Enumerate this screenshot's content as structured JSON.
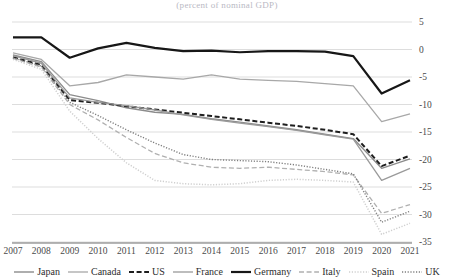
{
  "chart_data": {
    "type": "line",
    "title": "(percent of nominal GDP)",
    "xlabel": "",
    "ylabel": "",
    "x": [
      2007,
      2008,
      2009,
      2010,
      2011,
      2012,
      2013,
      2014,
      2015,
      2016,
      2017,
      2018,
      2019,
      2020,
      2021
    ],
    "xtick_labels": [
      "2007",
      "2008",
      "2009",
      "2010",
      "2011",
      "2012",
      "2013",
      "2014",
      "2015",
      "2016",
      "2017",
      "2018",
      "2019",
      "2020",
      "2021"
    ],
    "ytick_labels": [
      "5",
      "0",
      "-5",
      "-10",
      "-15",
      "-20",
      "-25",
      "-30",
      "-35"
    ],
    "ytick_values": [
      5,
      0,
      -5,
      -10,
      -15,
      -20,
      -25,
      -30,
      -35
    ],
    "ylim": [
      -35,
      5
    ],
    "grid": true,
    "legend_position": "bottom",
    "series": [
      {
        "name": "Japan",
        "color": "#8c8c8c",
        "style": "solid",
        "width": 1.4,
        "values": [
          -1.0,
          -2.2,
          -8.2,
          -9.3,
          -10.6,
          -11.4,
          -11.8,
          -12.6,
          -13.2,
          -13.9,
          -14.6,
          -15.4,
          -16.2,
          -21.6,
          -19.9
        ]
      },
      {
        "name": "Canada",
        "color": "#a8a8a8",
        "style": "solid",
        "width": 1.3,
        "values": [
          -0.6,
          -1.8,
          -6.6,
          -6.0,
          -4.6,
          -5.0,
          -5.4,
          -4.6,
          -5.4,
          -5.6,
          -5.8,
          -6.2,
          -6.6,
          -13.1,
          -11.7
        ]
      },
      {
        "name": "US",
        "color": "#1e1e1e",
        "style": "dashed",
        "width": 2.0,
        "values": [
          -1.4,
          -2.8,
          -9.2,
          -9.7,
          -10.3,
          -10.9,
          -11.5,
          -12.1,
          -12.7,
          -13.3,
          -13.9,
          -14.6,
          -15.4,
          -21.2,
          -19.3
        ]
      },
      {
        "name": "France",
        "color": "#9a9a9a",
        "style": "solid",
        "width": 1.3,
        "values": [
          -1.1,
          -2.5,
          -8.8,
          -9.6,
          -10.2,
          -11.0,
          -11.9,
          -12.7,
          -13.4,
          -14.0,
          -14.7,
          -15.5,
          -16.3,
          -23.8,
          -21.6
        ]
      },
      {
        "name": "Germany",
        "color": "#171717",
        "style": "solid",
        "width": 2.2,
        "values": [
          2.2,
          2.2,
          -1.5,
          0.2,
          1.2,
          0.3,
          -0.3,
          -0.2,
          -0.5,
          -0.3,
          -0.3,
          -0.4,
          -1.2,
          -8.0,
          -5.6
        ]
      },
      {
        "name": "Italy",
        "color": "#b0b0b0",
        "style": "dashed",
        "width": 1.3,
        "values": [
          -1.6,
          -3.2,
          -10.0,
          -12.8,
          -16.0,
          -18.9,
          -20.6,
          -21.4,
          -21.6,
          -21.4,
          -21.8,
          -22.2,
          -22.8,
          -29.8,
          -28.2
        ]
      },
      {
        "name": "Spain",
        "color": "#cfcfcf",
        "style": "dotted",
        "width": 1.5,
        "values": [
          -1.8,
          -3.6,
          -11.2,
          -16.2,
          -20.6,
          -23.8,
          -24.4,
          -24.6,
          -24.4,
          -23.8,
          -23.6,
          -23.8,
          -24.1,
          -33.6,
          -31.6
        ]
      },
      {
        "name": "UK",
        "color": "#7f7f7f",
        "style": "dotted",
        "width": 1.4,
        "values": [
          -1.5,
          -3.0,
          -9.6,
          -12.0,
          -14.6,
          -17.0,
          -19.1,
          -20.0,
          -20.2,
          -20.4,
          -21.0,
          -21.8,
          -22.6,
          -31.4,
          -29.4
        ]
      }
    ]
  },
  "legend": {
    "items": [
      {
        "label": "Japan"
      },
      {
        "label": "Canada"
      },
      {
        "label": "US"
      },
      {
        "label": "France"
      },
      {
        "label": "Germany"
      },
      {
        "label": "Italy"
      },
      {
        "label": "Spain"
      },
      {
        "label": "UK"
      }
    ]
  }
}
